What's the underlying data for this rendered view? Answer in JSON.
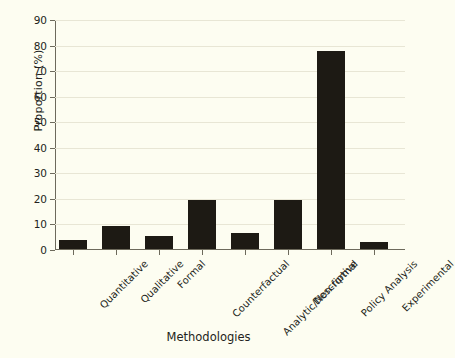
{
  "chart_data": {
    "type": "bar",
    "title": "",
    "xlabel": "Methodologies",
    "ylabel": "Proportion (%)",
    "categories": [
      "Quantitative",
      "Qualitative",
      "Formal",
      "Counterfactual",
      "Analytic/Non-formal",
      "Descriptive",
      "Policy Analysis",
      "Experimental"
    ],
    "values": [
      3.7,
      9.0,
      5.0,
      19.3,
      6.4,
      19.1,
      77.4,
      2.7
    ],
    "ylim": [
      0,
      90
    ],
    "yticks": [
      0,
      10,
      20,
      30,
      40,
      50,
      60,
      70,
      80,
      90
    ],
    "ytick_labels": [
      "0",
      "10",
      "20",
      "30",
      "40",
      "50",
      "60",
      "70",
      "80",
      "90"
    ],
    "grid": true,
    "legend": null,
    "bar_color": "#1d1a14",
    "background_color": "#fdfdf1",
    "axis_color": "#6d6a5c",
    "grid_color": "#e8e6d5"
  }
}
